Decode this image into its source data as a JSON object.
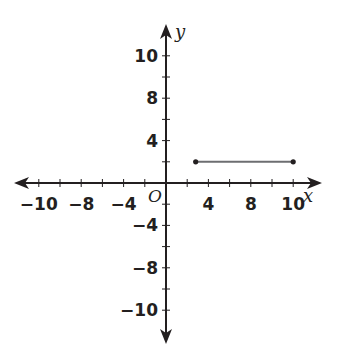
{
  "chart_data": {
    "type": "line",
    "title": "",
    "xlabel": "x",
    "ylabel": "y",
    "origin_label": "O",
    "grid": false,
    "tick_count_each_side": 6,
    "x_tick_labels": [
      {
        "tick": -6,
        "label": "−10"
      },
      {
        "tick": -4,
        "label": "−8"
      },
      {
        "tick": -2,
        "label": "−4"
      },
      {
        "tick": 2,
        "label": "4"
      },
      {
        "tick": 4,
        "label": "8"
      },
      {
        "tick": 6,
        "label": "10"
      }
    ],
    "y_tick_labels": [
      {
        "tick": 6,
        "label": "10"
      },
      {
        "tick": 4,
        "label": "8"
      },
      {
        "tick": 2,
        "label": "4"
      },
      {
        "tick": -2,
        "label": "−4"
      },
      {
        "tick": -4,
        "label": "−8"
      },
      {
        "tick": -6,
        "label": "−10"
      }
    ],
    "series": [
      {
        "name": "horizontal segment",
        "points_in_ticks": [
          [
            1.4,
            1
          ],
          [
            6,
            1
          ]
        ],
        "endpoints": "closed dots",
        "color": "#6d6e71"
      }
    ]
  },
  "colors": {
    "axis": "#231f20",
    "segment": "#6d6e71",
    "background": "#ffffff"
  }
}
